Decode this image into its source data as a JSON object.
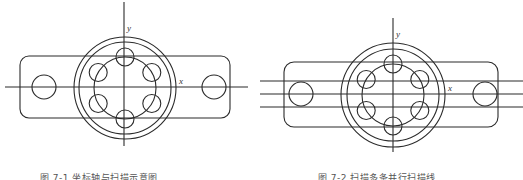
{
  "figures": [
    {
      "id": "left",
      "caption": "图 7-1  坐标轴与扫描示意图",
      "axis_labels": {
        "x": "x",
        "y": "y"
      },
      "geometry": {
        "center": [
          125,
          88
        ],
        "flange_radii": [
          51,
          46
        ],
        "bolt_circle_radius": 31,
        "bolt_hole_radius": 9,
        "bolt_hole_count": 6,
        "plate": {
          "x": 20,
          "y": 56,
          "w": 210,
          "h": 62,
          "rx": 9
        },
        "end_holes": [
          [
            44,
            87,
            12
          ],
          [
            214,
            87,
            12
          ]
        ],
        "x_axis": {
          "y": 87,
          "x1": 5,
          "x2": 248
        },
        "y_axis": {
          "x": 124,
          "y1": 2,
          "y2": 146
        },
        "scan_lines_y": []
      }
    },
    {
      "id": "right",
      "caption": "图 7-2  扫描多条并行扫描线",
      "axis_labels": {
        "x": "x",
        "y": "y"
      },
      "geometry": {
        "center": [
          393,
          95
        ],
        "flange_radii": [
          52,
          46
        ],
        "bolt_circle_radius": 31,
        "bolt_hole_radius": 9,
        "bolt_hole_count": 6,
        "plate": {
          "x": 284,
          "y": 62,
          "w": 214,
          "h": 65,
          "rx": 10
        },
        "end_holes": [
          [
            301,
            94,
            12
          ],
          [
            485,
            94,
            12
          ]
        ],
        "x_axis": {
          "y": 94,
          "x1": 260,
          "x2": 523
        },
        "y_axis": {
          "x": 393,
          "y1": 18,
          "y2": 152
        },
        "scan_lines_y": [
          81,
          107
        ]
      }
    }
  ],
  "colors": {
    "line": "#2b2b2b",
    "label": "#333333",
    "caption": "#555555",
    "background": "#ffffff"
  }
}
